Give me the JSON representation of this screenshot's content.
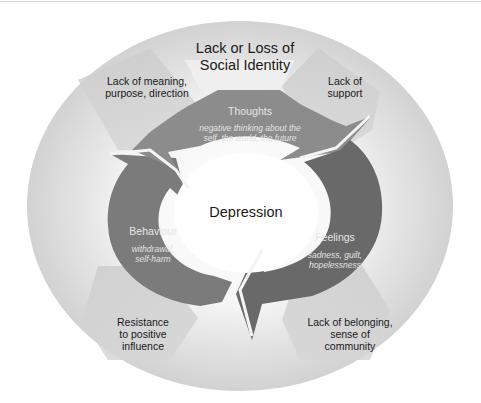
{
  "diagram": {
    "title": "Lack or Loss of\nSocial Identity",
    "center": {
      "label": "Depression"
    },
    "cycle": [
      {
        "id": "thoughts",
        "label": "Thoughts",
        "description": "negative thinking about the\nself, the world, the future",
        "color": "#8c8c8c"
      },
      {
        "id": "feelings",
        "label": "Feelings",
        "description": "sadness, guilt,\nhopelessness",
        "color": "#696969"
      },
      {
        "id": "behaviour",
        "label": "Behaviour",
        "description": "withdrawal,\nself-harm",
        "color": "#7b7b7b"
      }
    ],
    "outer_factors": [
      {
        "id": "meaning",
        "label": "Lack of meaning,\npurpose, direction"
      },
      {
        "id": "support",
        "label": "Lack of\nsupport"
      },
      {
        "id": "resistance",
        "label": "Resistance\nto positive\ninfluence"
      },
      {
        "id": "belonging",
        "label": "Lack of belonging,\nsense of\ncommunity"
      }
    ],
    "colors": {
      "outer_ring": "#d4d4d4",
      "outer_ring_inner_glow": "#f4f4f4",
      "factor_arrow": "#c9c9c9",
      "center_fill": "#ffffff",
      "text": "#1a1a1a",
      "cycle_text": "#e6e6e6"
    }
  }
}
